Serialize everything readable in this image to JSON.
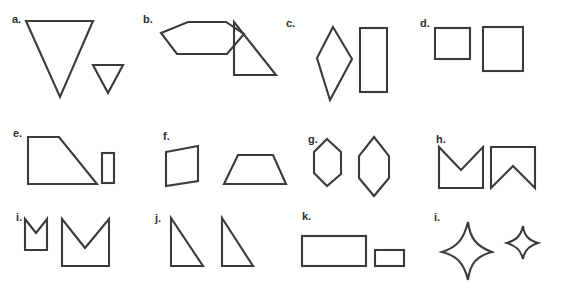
{
  "sheet": {
    "width": 563,
    "height": 296,
    "background_color": "#ffffff",
    "stroke_color": "#3b3b3b",
    "label_color": "#2f2f2f",
    "description": "Worksheet of twelve lettered panels, each showing a pair of outlined geometric shapes"
  },
  "panels": [
    {
      "id": "a",
      "label": "a.",
      "label_x": 12,
      "label_y": 14,
      "shapes": [
        {
          "name": "large-inverted-triangle",
          "type": "polygon",
          "points": "26,21 93,21 60,97"
        },
        {
          "name": "small-inverted-triangle",
          "type": "polygon",
          "points": "93,65 123,65 108,93"
        }
      ]
    },
    {
      "id": "b",
      "label": "b.",
      "label_x": 143,
      "label_y": 14,
      "shapes": [
        {
          "name": "horizontal-hexagon",
          "type": "polygon",
          "points": "161,33 188,22 226,22 244,34 227,54 177,54"
        },
        {
          "name": "right-triangle",
          "type": "polygon",
          "points": "234,22 234,75 276,75"
        }
      ]
    },
    {
      "id": "c",
      "label": "c.",
      "label_x": 286,
      "label_y": 18,
      "shapes": [
        {
          "name": "tall-rhombus",
          "type": "polygon",
          "points": "333,27 352,59 330,100 317,58"
        },
        {
          "name": "vertical-rectangle",
          "type": "rect",
          "x": 360,
          "y": 28,
          "width": 27,
          "height": 64
        }
      ]
    },
    {
      "id": "d",
      "label": "d.",
      "label_x": 420,
      "label_y": 18,
      "shapes": [
        {
          "name": "small-square",
          "type": "rect",
          "x": 435,
          "y": 28,
          "width": 35,
          "height": 31
        },
        {
          "name": "large-square",
          "type": "rect",
          "x": 483,
          "y": 27,
          "width": 40,
          "height": 44
        }
      ]
    },
    {
      "id": "e",
      "label": "e.",
      "label_x": 13,
      "label_y": 128,
      "shapes": [
        {
          "name": "right-trapezoid",
          "type": "polygon",
          "points": "28,137 59,137 97,184 28,184"
        },
        {
          "name": "small-vertical-rectangle",
          "type": "rect",
          "x": 102,
          "y": 153,
          "width": 12,
          "height": 30
        }
      ]
    },
    {
      "id": "f",
      "label": "f.",
      "label_x": 163,
      "label_y": 131,
      "shapes": [
        {
          "name": "left-trapezoid",
          "type": "polygon",
          "points": "166,152 198,146 198,181 166,186"
        },
        {
          "name": "isosceles-trapezoid",
          "type": "polygon",
          "points": "238,155 273,155 286,184 224,184"
        }
      ]
    },
    {
      "id": "g",
      "label": "g.",
      "label_x": 308,
      "label_y": 134,
      "shapes": [
        {
          "name": "small-vertical-hexagon",
          "type": "polygon",
          "points": "327,139 341,152 341,174 327,186 314,173 314,152"
        },
        {
          "name": "large-vertical-hexagon",
          "type": "polygon",
          "points": "374,137 389,156 389,178 374,196 359,178 359,156"
        }
      ]
    },
    {
      "id": "h",
      "label": "h.",
      "label_x": 436,
      "label_y": 134,
      "shapes": [
        {
          "name": "crown-notched-top-square",
          "type": "polygon",
          "points": "439,147 461,170 483,147 483,188 439,188"
        },
        {
          "name": "banner-notched-bottom-square",
          "type": "polygon",
          "points": "491,147 535,147 535,188 513,166 491,188"
        }
      ]
    },
    {
      "id": "i",
      "label": "i.",
      "label_x": 16,
      "label_y": 212,
      "shapes": [
        {
          "name": "small-crown",
          "type": "polygon",
          "points": "25,219 36,233 47,219 47,250 25,250"
        },
        {
          "name": "large-crown",
          "type": "polygon",
          "points": "62,219 85,248 109,219 109,266 62,266"
        }
      ]
    },
    {
      "id": "j",
      "label": "j.",
      "label_x": 155,
      "label_y": 213,
      "shapes": [
        {
          "name": "right-triangle-left",
          "type": "polygon",
          "points": "171,218 171,266 203,266"
        },
        {
          "name": "right-triangle-right",
          "type": "polygon",
          "points": "222,218 222,266 253,266"
        }
      ]
    },
    {
      "id": "k",
      "label": "k.",
      "label_x": 302,
      "label_y": 211,
      "shapes": [
        {
          "name": "large-horizontal-rectangle",
          "type": "rect",
          "x": 302,
          "y": 236,
          "width": 64,
          "height": 30
        },
        {
          "name": "small-horizontal-rectangle",
          "type": "rect",
          "x": 375,
          "y": 250,
          "width": 29,
          "height": 16
        }
      ]
    },
    {
      "id": "l",
      "label": "i.",
      "label_x": 434,
      "label_y": 212,
      "shapes": [
        {
          "name": "large-four-point-star",
          "type": "path",
          "d": "M468,222 C470,238 476,246 492,252 C477,256 470,263 468,280 C464,264 458,256 442,252 C458,247 464,238 468,222 Z"
        },
        {
          "name": "small-four-point-star",
          "type": "path",
          "d": "M523,226 C524,235 528,240 538,243 C528,246 524,251 523,259 C521,251 517,246 507,243 C517,240 521,235 523,226 Z"
        }
      ]
    }
  ]
}
